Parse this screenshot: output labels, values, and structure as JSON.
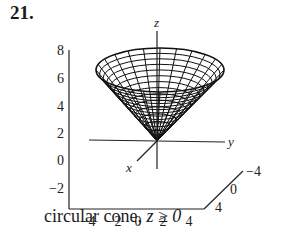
{
  "exercise": {
    "number": "21."
  },
  "figure": {
    "type": "3d-surface-plot",
    "surface": "circular cone",
    "axis_labels": {
      "x": "x",
      "y": "y",
      "z": "z"
    },
    "z_ticks": [
      "8",
      "6",
      "4",
      "2",
      "0",
      "−2"
    ],
    "bottom_ticks": [
      "−4",
      "−2",
      "0",
      "2",
      "4"
    ],
    "depth_ticks": [
      "−4",
      "0",
      "4"
    ]
  },
  "caption": {
    "text": "circular cone, ",
    "condition": "z ≥ 0"
  }
}
